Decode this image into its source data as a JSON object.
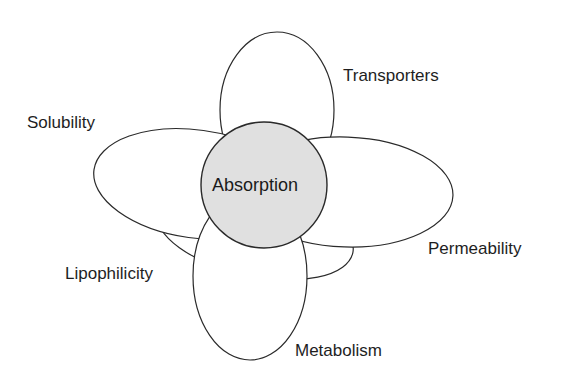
{
  "diagram": {
    "center": {
      "label": "Absorption",
      "fill": "#e0e0e0"
    },
    "factors": [
      {
        "id": "transporters",
        "label": "Transporters"
      },
      {
        "id": "solubility",
        "label": "Solubility"
      },
      {
        "id": "permeability",
        "label": "Permeability"
      },
      {
        "id": "lipophilicity",
        "label": "Lipophilicity"
      },
      {
        "id": "metabolism",
        "label": "Metabolism"
      }
    ],
    "colors": {
      "stroke": "#2a2a2a",
      "lobe_fill": "#ffffff",
      "text": "#1e1e1e"
    }
  }
}
